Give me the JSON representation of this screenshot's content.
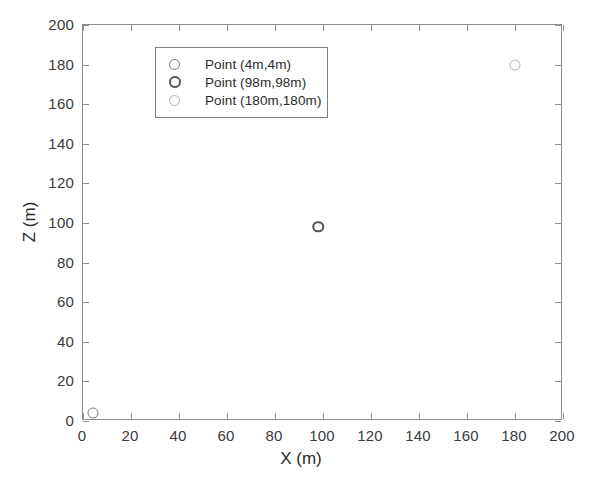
{
  "chart_data": {
    "type": "scatter",
    "title": "",
    "xlabel": "X (m)",
    "ylabel": "Z (m)",
    "xlim": [
      0,
      200
    ],
    "ylim": [
      0,
      200
    ],
    "xticks": [
      0,
      20,
      40,
      60,
      80,
      100,
      120,
      140,
      160,
      180,
      200
    ],
    "yticks": [
      0,
      20,
      40,
      60,
      80,
      100,
      120,
      140,
      160,
      180,
      200
    ],
    "xticklabels": [
      "0",
      "20",
      "40",
      "60",
      "80",
      "100",
      "120",
      "140",
      "160",
      "180",
      "200"
    ],
    "yticklabels": [
      "0",
      "20",
      "40",
      "60",
      "80",
      "100",
      "120",
      "140",
      "160",
      "180",
      "200"
    ],
    "grid": false,
    "legend_position": "upper-left-inset",
    "series": [
      {
        "name": "Point (4m,4m)",
        "marker": "circle-open",
        "color": "#7a7a7a",
        "points": [
          {
            "x": 4,
            "y": 4
          }
        ]
      },
      {
        "name": "Point (98m,98m)",
        "marker": "circle-open",
        "color": "#545454",
        "points": [
          {
            "x": 98,
            "y": 98
          }
        ]
      },
      {
        "name": "Point (180m,180m)",
        "marker": "circle-open",
        "color": "#b4b4b4",
        "points": [
          {
            "x": 180,
            "y": 180
          }
        ]
      }
    ]
  },
  "legend": {
    "entries": [
      {
        "label": "Point (4m,4m)"
      },
      {
        "label": "Point (98m,98m)"
      },
      {
        "label": "Point (180m,180m)"
      }
    ]
  },
  "axes": {
    "x_title": "X (m)",
    "y_title": "Z (m)"
  }
}
